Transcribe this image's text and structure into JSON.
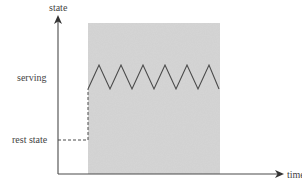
{
  "diagram": {
    "y_axis_label": "state",
    "x_axis_label": "time",
    "levels": {
      "serving": "serving",
      "rest": "rest state"
    },
    "colors": {
      "shade": "#d4d4d4",
      "line": "#4a4a4a",
      "axis": "#4a4a4a",
      "text": "#444444"
    },
    "zigzag": {
      "peaks": 6,
      "peak_level": "serving (upper)",
      "trough_level": "serving (lower)"
    },
    "transition": "dashed line from rest state rising to serving at start of shaded region"
  }
}
